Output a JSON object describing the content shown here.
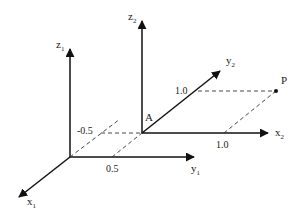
{
  "diagram": {
    "colors": {
      "line": "#111111",
      "dash": "#333333",
      "text": "#222222",
      "background": "#ffffff"
    },
    "frames": [
      {
        "name": "frame-1",
        "origin": [
          70,
          157
        ],
        "axes": {
          "x": {
            "label": "x",
            "sub": "1"
          },
          "y": {
            "label": "y",
            "sub": "1"
          },
          "z": {
            "label": "z",
            "sub": "1"
          }
        }
      },
      {
        "name": "frame-2",
        "origin_label": "A",
        "origin": [
          142,
          133
        ],
        "axes": {
          "x": {
            "label": "x",
            "sub": "2"
          },
          "y": {
            "label": "y",
            "sub": "2"
          },
          "z": {
            "label": "z",
            "sub": "2"
          }
        }
      }
    ],
    "point": {
      "label": "P"
    },
    "ticks": {
      "y1_half": "0.5",
      "x1_neg_half": "-0.5",
      "y2_one": "1.0",
      "x2_one": "1.0"
    }
  }
}
